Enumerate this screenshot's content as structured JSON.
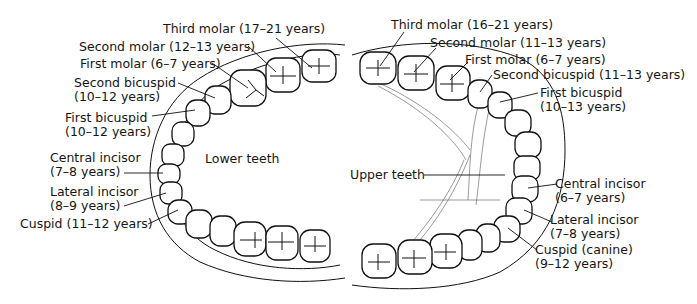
{
  "diagram": {
    "lower": {
      "title": "Lower teeth",
      "labels": [
        {
          "name": "Third molar",
          "age": "(17–21 years)"
        },
        {
          "name": "Second molar",
          "age": "(12–13 years)"
        },
        {
          "name": "First molar",
          "age": "(6–7 years)"
        },
        {
          "name": "Second bicuspid",
          "age": "(10–12 years)"
        },
        {
          "name": "First bicuspid",
          "age": "(10–12 years)"
        },
        {
          "name": "Central incisor",
          "age": "(7–8 years)"
        },
        {
          "name": "Lateral incisor",
          "age": "(8–9 years)"
        },
        {
          "name": "Cuspid",
          "age": "(11–12 years)"
        }
      ]
    },
    "upper": {
      "title": "Upper teeth",
      "labels": [
        {
          "name": "Third molar",
          "age": "(16–21 years)"
        },
        {
          "name": "Second molar",
          "age": "(11–13 years)"
        },
        {
          "name": "First molar",
          "age": "(6–7 years)"
        },
        {
          "name": "Second bicuspid",
          "age": "(11–13 years)"
        },
        {
          "name": "First bicuspid",
          "age": "(10–13 years)"
        },
        {
          "name": "Central incisor",
          "age": "(6–7 years)"
        },
        {
          "name": "Lateral incisor",
          "age": "(7–8 years)"
        },
        {
          "name": "Cuspid (canine)",
          "age": "(9–12 years)"
        }
      ]
    }
  }
}
